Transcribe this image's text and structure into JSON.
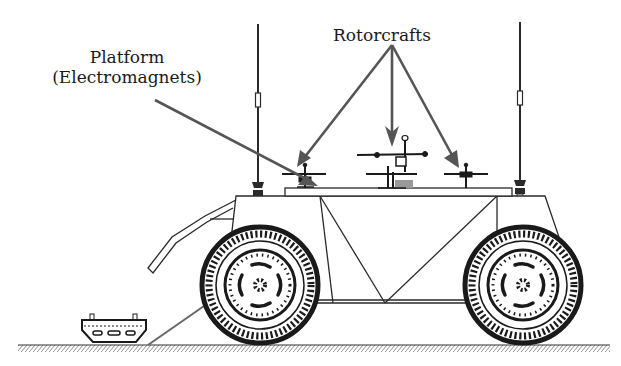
{
  "figure": {
    "labels": {
      "platform_line1": "Platform",
      "platform_line2": "(Electromagnets)",
      "rotorcrafts": "Rotorcrafts"
    },
    "components": [
      "vehicle-body",
      "front-wheel",
      "rear-wheel",
      "front-antenna",
      "rear-antenna",
      "platform",
      "rotorcraft-left",
      "rotorcraft-center",
      "rotorcraft-right",
      "front-bumper-frame",
      "ramp",
      "small-tracked-robot",
      "ground"
    ],
    "colors": {
      "line": "#2a2a2a",
      "arrow": "#555555",
      "background": "#ffffff"
    }
  }
}
